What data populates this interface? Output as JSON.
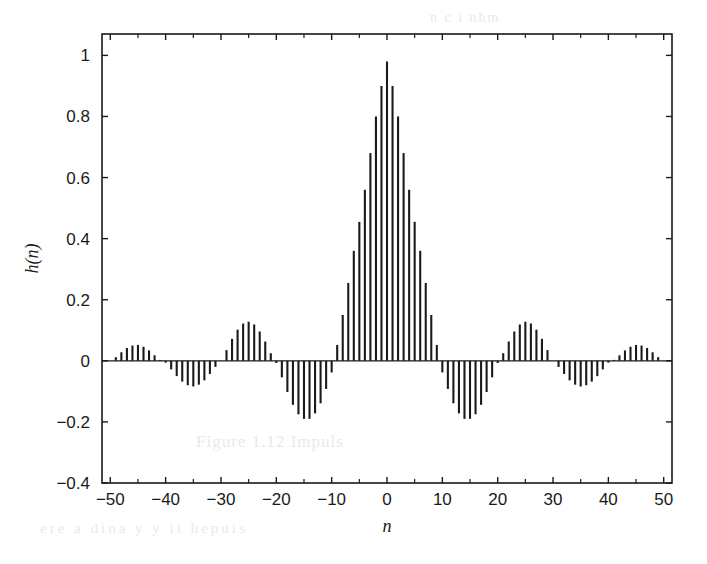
{
  "figure": {
    "background_color": "#ffffff",
    "line_color": "#1a1a1a",
    "bleed_through": {
      "caption": "Figure 1.12  Impuls",
      "line": "ere a dina  y  y ii hepuis",
      "top": "n   c  i  nhm"
    }
  },
  "chart_data": {
    "type": "bar",
    "title": "",
    "subtitle": "",
    "xlabel": "n",
    "ylabel": "h(n)",
    "grid": false,
    "legend": null,
    "legend_position": "none",
    "bar_color": "#1a1a1a",
    "xlim": [
      -51.5,
      51.5
    ],
    "ylim": [
      -0.4,
      1.07
    ],
    "xticks": [
      -50,
      -40,
      -30,
      -20,
      -10,
      0,
      10,
      20,
      30,
      40,
      50
    ],
    "xtick_labels": [
      "−50",
      "−40",
      "−30",
      "−20",
      "−10",
      "0",
      "10",
      "20",
      "30",
      "40",
      "50"
    ],
    "xminor_ticks": [
      -45,
      -35,
      -25,
      -15,
      -5,
      5,
      15,
      25,
      35,
      45
    ],
    "yticks": [
      -0.4,
      -0.2,
      0,
      0.2,
      0.4,
      0.6,
      0.8,
      1
    ],
    "ytick_labels": [
      "−0.4",
      "−0.2",
      "0",
      "0.2",
      "0.4",
      "0.6",
      "0.8",
      "1"
    ],
    "x": [
      -50,
      -49,
      -48,
      -47,
      -46,
      -45,
      -44,
      -43,
      -42,
      -41,
      -40,
      -39,
      -38,
      -37,
      -36,
      -35,
      -34,
      -33,
      -32,
      -31,
      -30,
      -29,
      -28,
      -27,
      -26,
      -25,
      -24,
      -23,
      -22,
      -21,
      -20,
      -19,
      -18,
      -17,
      -16,
      -15,
      -14,
      -13,
      -12,
      -11,
      -10,
      -9,
      -8,
      -7,
      -6,
      -5,
      -4,
      -3,
      -2,
      -1,
      0,
      1,
      2,
      3,
      4,
      5,
      6,
      7,
      8,
      9,
      10,
      11,
      12,
      13,
      14,
      15,
      16,
      17,
      18,
      19,
      20,
      21,
      22,
      23,
      24,
      25,
      26,
      27,
      28,
      29,
      30,
      31,
      32,
      33,
      34,
      35,
      36,
      37,
      38,
      39,
      40,
      41,
      42,
      43,
      44,
      45,
      46,
      47,
      48,
      49,
      50
    ],
    "values": [
      0.0,
      0.012,
      0.028,
      0.042,
      0.05,
      0.052,
      0.046,
      0.034,
      0.018,
      0.003,
      -0.006,
      -0.028,
      -0.05,
      -0.068,
      -0.08,
      -0.084,
      -0.078,
      -0.064,
      -0.043,
      -0.02,
      0.0,
      0.035,
      0.072,
      0.102,
      0.122,
      0.128,
      0.119,
      0.096,
      0.063,
      0.025,
      -0.007,
      -0.054,
      -0.102,
      -0.144,
      -0.175,
      -0.19,
      -0.19,
      -0.172,
      -0.139,
      -0.092,
      -0.038,
      0.052,
      0.15,
      0.255,
      0.36,
      0.455,
      0.56,
      0.68,
      0.8,
      0.9,
      0.98,
      0.9,
      0.8,
      0.68,
      0.56,
      0.455,
      0.36,
      0.255,
      0.15,
      0.052,
      -0.038,
      -0.092,
      -0.139,
      -0.172,
      -0.19,
      -0.19,
      -0.175,
      -0.144,
      -0.102,
      -0.054,
      -0.007,
      0.025,
      0.063,
      0.096,
      0.119,
      0.128,
      0.122,
      0.102,
      0.072,
      0.035,
      0.0,
      -0.02,
      -0.043,
      -0.064,
      -0.078,
      -0.084,
      -0.08,
      -0.068,
      -0.05,
      -0.028,
      -0.006,
      0.003,
      0.018,
      0.034,
      0.046,
      0.052,
      0.05,
      0.042,
      0.028,
      0.012,
      0.0
    ]
  }
}
